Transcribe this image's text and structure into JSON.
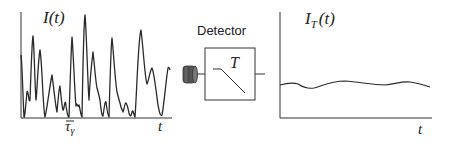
{
  "diagram": {
    "left_plot": {
      "ylabel": "I(t)",
      "ylabel_main": "I",
      "ylabel_arg": "(t)",
      "xlabel": "t",
      "tick_label": "τγ",
      "tick_label_main": "τ",
      "tick_label_sub": "γ",
      "tick_label_overbar": true,
      "description": "Rapidly fluctuating instantaneous intensity"
    },
    "detector": {
      "title": "Detector",
      "inner_label": "T",
      "description": "Detector with response time T"
    },
    "right_plot": {
      "ylabel": "I_T(t)",
      "ylabel_main": "I",
      "ylabel_sub": "T",
      "ylabel_arg": "(t)",
      "xlabel": "t",
      "description": "Time-averaged (smoothed) intensity"
    },
    "colors": {
      "stroke": "#2a2a2a",
      "cylinder": "#555555",
      "background": "#ffffff"
    }
  }
}
